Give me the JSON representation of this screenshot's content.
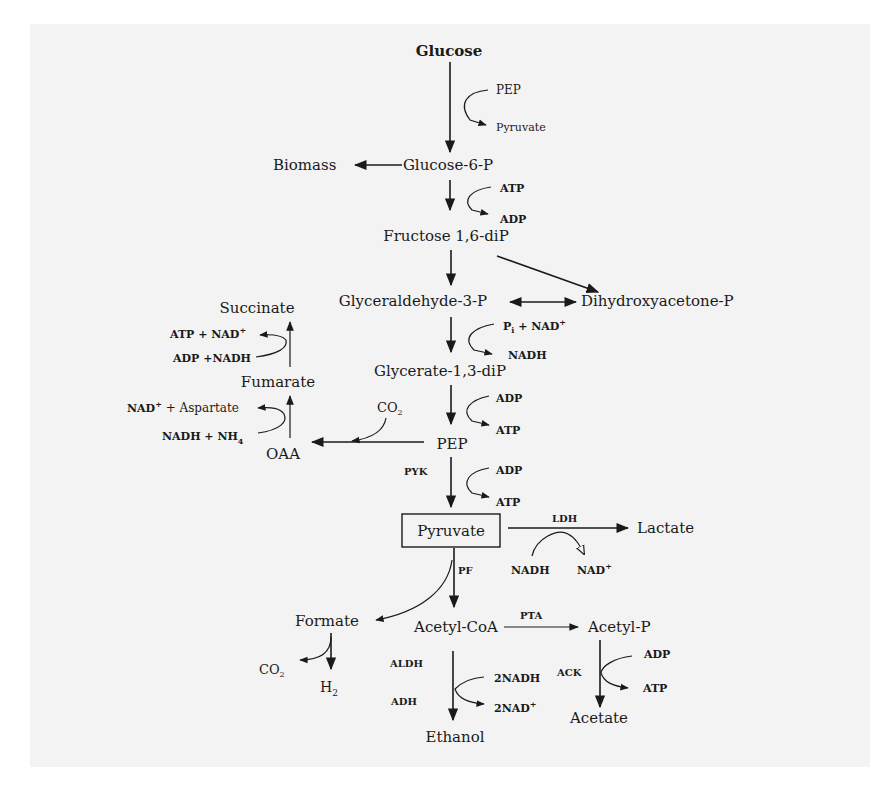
{
  "diagram": {
    "title": "Glucose",
    "colors": {
      "background": "#ffffff",
      "panel": "#f3f3f3",
      "ink": "#1a1a1a"
    },
    "metabolites": {
      "glucose": "Glucose",
      "glucose6p": "Glucose-6-P",
      "biomass": "Biomass",
      "fructose16dip": "Fructose 1,6-diP",
      "gap": "Glyceraldehyde-3-P",
      "dhap": "Dihydroxyacetone-P",
      "glycerate13dip": "Glycerate-1,3-diP",
      "pep": "PEP",
      "pyruvate": "Pyruvate",
      "lactate": "Lactate",
      "oaa": "OAA",
      "fumarate": "Fumarate",
      "succinate": "Succinate",
      "formate": "Formate",
      "acetylcoa": "Acetyl-CoA",
      "acetylp": "Acetyl-P",
      "acetate": "Acetate",
      "ethanol": "Ethanol",
      "co2_formate": "CO",
      "co2_formate_sub": "2",
      "h2": "H",
      "h2_sub": "2"
    },
    "cofactors": {
      "pts_in": "PEP",
      "pts_out": "Pyruvate",
      "pfk_in": "ATP",
      "pfk_out": "ADP",
      "gapdh_in_p": "P",
      "gapdh_in_sub": "i",
      "gapdh_in_rest": " + NAD",
      "gapdh_in_sup": "+",
      "gapdh_out": "NADH",
      "pgk_in": "ADP",
      "pgk_out": "ATP",
      "pyk_in": "ADP",
      "pyk_out": "ATP",
      "ppc_co2": "CO",
      "ppc_co2_sub": "2",
      "asp_in": "NADH + NH",
      "asp_in_sub": "4",
      "asp_out": "NAD",
      "asp_out_sup": "+",
      "asp_out_rest": " + Aspartate",
      "frd_in": "ADP +NADH",
      "frd_out": "ATP + NAD",
      "frd_out_sup": "+",
      "ldh_in": "NADH",
      "ldh_out": "NAD",
      "ldh_out_sup": "+",
      "adh_in": "2NADH",
      "adh_out": "2NAD",
      "adh_out_sup": "+",
      "ack_in": "ADP",
      "ack_out": "ATP"
    },
    "enzymes": {
      "pyk": "PYK",
      "ldh": "LDH",
      "pfl": "PF",
      "pta": "PTA",
      "ack": "ACK",
      "aldh": "ALDH",
      "adh": "ADH"
    }
  }
}
